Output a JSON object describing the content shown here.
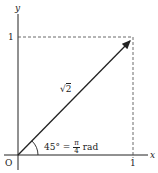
{
  "diagram": {
    "axes": {
      "x_label": "x",
      "y_label": "y",
      "origin_label": "O",
      "x_tick_label": "1",
      "y_tick_label": "1"
    },
    "vector": {
      "length_symbol": "√",
      "length_value": "2",
      "from": [
        0,
        0
      ],
      "to": [
        1,
        1
      ]
    },
    "angle": {
      "degrees": "45°",
      "equals": "=",
      "numerator": "π",
      "denominator": "4",
      "unit": "rad"
    },
    "colors": {
      "line": "#222222",
      "dashed": "#444444",
      "background": "#ffffff"
    }
  }
}
